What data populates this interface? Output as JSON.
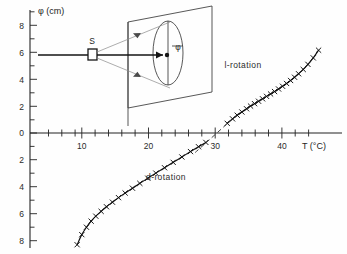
{
  "figure": {
    "name": "optical-rotation-vs-temperature",
    "background": "#fefefe",
    "ink_color": "#1a1a1a"
  },
  "chart_data": {
    "type": "scatter",
    "title": "",
    "xlabel": "T (°C)",
    "ylabel": "φ (cm)",
    "xlim": [
      4,
      48
    ],
    "ylim": [
      -9,
      9
    ],
    "xticks": [
      10,
      20,
      30,
      40
    ],
    "xtick_labels": [
      "10",
      "20",
      "30",
      "40"
    ],
    "xminor_step": 2,
    "yticks": [
      8,
      6,
      4,
      2,
      0,
      -2,
      -4,
      -6,
      -8
    ],
    "ytick_labels": [
      "8",
      "6",
      "4",
      "2",
      "0",
      "2",
      "4",
      "6",
      "8"
    ],
    "yminor_step": 1,
    "grid": false,
    "legend": "none",
    "zero_crossing_T": 30,
    "annotations": [
      {
        "name": "l-rotation-label",
        "text": "l-rotation",
        "x": 36.5,
        "y": 4.3
      },
      {
        "name": "d-rotation-label",
        "text": "d-rotation",
        "x": 24.2,
        "y": -4.0
      }
    ],
    "series": [
      {
        "name": "d-rotation",
        "marker": "x",
        "linestyle": "solid",
        "x": [
          9.3,
          10.0,
          10.7,
          11.4,
          12.1,
          12.9,
          13.7,
          14.6,
          15.5,
          16.5,
          17.6,
          18.7,
          19.9,
          21.1,
          22.4,
          23.7,
          25.0,
          26.3,
          27.5,
          28.6
        ],
        "y": [
          -8.3,
          -7.55,
          -7.0,
          -6.55,
          -6.18,
          -5.82,
          -5.48,
          -5.14,
          -4.8,
          -4.46,
          -4.1,
          -3.74,
          -3.36,
          -2.98,
          -2.58,
          -2.18,
          -1.78,
          -1.38,
          -1.02,
          -0.7
        ]
      },
      {
        "name": "l-rotation",
        "marker": "x",
        "linestyle": "solid",
        "x": [
          31.8,
          32.6,
          33.3,
          34.0,
          34.7,
          35.3,
          35.9,
          36.5,
          37.1,
          37.7,
          38.3,
          38.9,
          39.5,
          40.1,
          40.7,
          41.3,
          41.9,
          42.5,
          43.2,
          43.9,
          44.7,
          45.5
        ],
        "y": [
          0.72,
          1.05,
          1.32,
          1.56,
          1.8,
          2.0,
          2.18,
          2.36,
          2.54,
          2.72,
          2.9,
          3.08,
          3.27,
          3.47,
          3.68,
          3.9,
          4.14,
          4.4,
          4.72,
          5.1,
          5.58,
          6.15
        ]
      },
      {
        "name": "extrapolation-dashed",
        "marker": "none",
        "linestyle": "dashed",
        "x": [
          27.0,
          33.5
        ],
        "y": [
          -1.45,
          1.45
        ]
      }
    ]
  },
  "inset": {
    "name": "polarimeter-schematic",
    "source_label": "S",
    "angle_label": "φ",
    "description": "light source S projecting a beam onto a screen plane with an elliptical polarization figure"
  }
}
